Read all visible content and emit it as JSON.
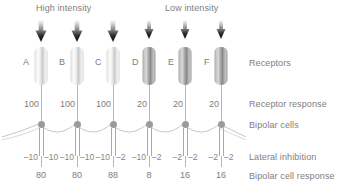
{
  "headings": {
    "high_intensity": "High intensity",
    "low_intensity": "Low intensity"
  },
  "row_labels": {
    "receptors": "Receptors",
    "receptor_response": "Receptor response",
    "bipolar_cells": "Bipolar cells",
    "lateral_inhibition": "Lateral inhibition",
    "bipolar_cell_response": "Bipolar cell response"
  },
  "colors": {
    "text": "#808080",
    "line": "#b6b6b6",
    "soma": "#9b9b9b",
    "arrow": "#1a1a1a",
    "receptor_bright": "#f2f2f2",
    "receptor_dim": "#a8a8a8"
  },
  "icons": {
    "stimulus_arrow": "down-arrow-icon"
  },
  "columns": [
    {
      "letter": "A",
      "illumination": "high",
      "receptor_response": "100",
      "inhibition_left": "–10",
      "inhibition_right": "–10",
      "bipolar_response": "80"
    },
    {
      "letter": "B",
      "illumination": "high",
      "receptor_response": "100",
      "inhibition_left": "–10",
      "inhibition_right": "–10",
      "bipolar_response": "80"
    },
    {
      "letter": "C",
      "illumination": "high",
      "receptor_response": "100",
      "inhibition_left": "–10",
      "inhibition_right": "–2",
      "bipolar_response": "88"
    },
    {
      "letter": "D",
      "illumination": "low",
      "receptor_response": "20",
      "inhibition_left": "–10",
      "inhibition_right": "–2",
      "bipolar_response": "8"
    },
    {
      "letter": "E",
      "illumination": "low",
      "receptor_response": "20",
      "inhibition_left": "–2",
      "inhibition_right": "–2",
      "bipolar_response": "16"
    },
    {
      "letter": "F",
      "illumination": "low",
      "receptor_response": "20",
      "inhibition_left": "–2",
      "inhibition_right": "–2",
      "bipolar_response": "16"
    }
  ]
}
